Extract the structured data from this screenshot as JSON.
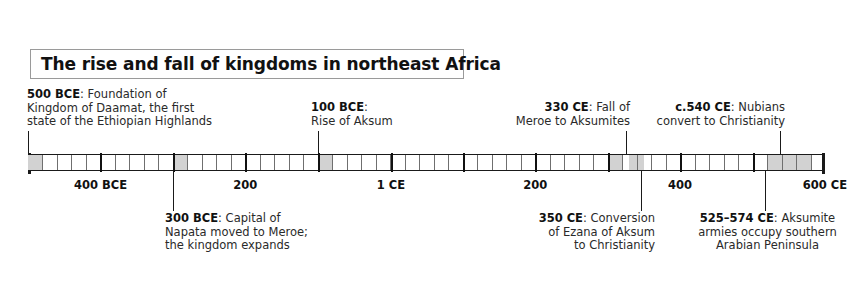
{
  "title": "The rise and fall of kingdoms in northeast Africa",
  "timeline": {
    "start_year": -500,
    "end_year": 600,
    "axis_labels": [
      {
        "text": "400 BCE",
        "year": -400
      },
      {
        "text": "200",
        "year": -200
      },
      {
        "text": "1 CE",
        "year": 1
      },
      {
        "text": "200",
        "year": 200
      },
      {
        "text": "400",
        "year": 400
      },
      {
        "text": "600 CE",
        "year": 600
      }
    ],
    "century_ticks": [
      -400,
      -300,
      -200,
      -100,
      1,
      100,
      200,
      300,
      400,
      500,
      600
    ],
    "cell_span_years": 20,
    "highlight_bands": [
      {
        "from": -500,
        "to": -480
      },
      {
        "from": -300,
        "to": -280
      },
      {
        "from": -100,
        "to": -80
      },
      {
        "from": 300,
        "to": 320
      },
      {
        "from": 330,
        "to": 350
      },
      {
        "from": 520,
        "to": 580
      }
    ]
  },
  "events_above": [
    {
      "lead": "500 BCE",
      "body": ": Foundation of\nKingdom of Daamat, the first\nstate of the Ethiopian Highlands",
      "year": -500,
      "align": "left"
    },
    {
      "lead": "100 BCE",
      "body": ":\nRise of Aksum",
      "year": -100,
      "align": "left"
    },
    {
      "lead": "330 CE",
      "body": ": Fall of\nMeroe to Aksumites",
      "year": 330,
      "align": "right"
    },
    {
      "lead": "c.540 CE",
      "body": ": Nubians\nconvert to Christianity",
      "year": 540,
      "align": "right"
    }
  ],
  "events_below": [
    {
      "lead": "300 BCE",
      "body": ": Capital of\nNapata moved to Meroe;\nthe kingdom expands",
      "year": -300,
      "align": "left"
    },
    {
      "lead": "350 CE",
      "body": ": Conversion\nof Ezana of Aksum\nto Christianity",
      "year": 350,
      "align": "right"
    },
    {
      "lead": "525–574 CE",
      "body": ": Aksumite\narmies occupy southern\nArabian Peninsula",
      "year": 525,
      "align": "center"
    }
  ],
  "colors": {
    "ink": "#1a1a1a",
    "band": "#d2d2d2",
    "rule": "#6f6f6f",
    "box_border": "#9a9a9a",
    "background": "#ffffff"
  }
}
